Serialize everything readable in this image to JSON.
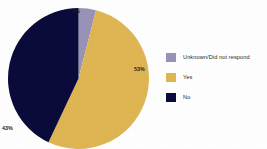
{
  "chart_data": {
    "type": "pie",
    "title": "",
    "subtitle": "",
    "xlabel": "",
    "ylabel": "",
    "grid": false,
    "legend_position": "right",
    "categories": [
      "Unknown/Did not respond",
      "Yes",
      "No"
    ],
    "values": [
      4,
      53,
      43
    ],
    "value_labels": [
      "4%",
      "53%",
      "43%"
    ],
    "colors": [
      "#9A93B8",
      "#E0B653",
      "#0B0B3B"
    ],
    "start_angle_deg": 0,
    "direction": "clockwise",
    "total": 100,
    "units": "percent",
    "annotations": []
  },
  "chart": {
    "title_text": ""
  },
  "slice_labels": {
    "unknown": "4%",
    "yes": "53%",
    "no": "43%"
  },
  "legend": {
    "items": [
      {
        "label": "Unknown/Did not respond",
        "color": "#9A93B8"
      },
      {
        "label": "Yes",
        "color": "#E0B653"
      },
      {
        "label": "No",
        "color": "#0B0B3B"
      }
    ]
  },
  "palette": {
    "unknown": "#9A93B8",
    "yes": "#E0B653",
    "no": "#0B0B3B",
    "background": "#FFFFFF",
    "text": "#262626"
  }
}
